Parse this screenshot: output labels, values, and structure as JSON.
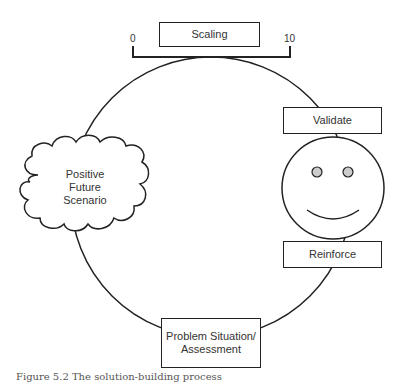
{
  "diagram": {
    "nodes": {
      "scaling": {
        "label": "Scaling"
      },
      "scale_min": {
        "label": "0"
      },
      "scale_max": {
        "label": "10"
      },
      "validate": {
        "label": "Validate"
      },
      "reinforce": {
        "label": "Reinforce"
      },
      "positive_future": {
        "line1": "Positive",
        "line2": "Future",
        "line3": "Scenario"
      },
      "problem": {
        "line1": "Problem Situation/",
        "line2": "Assessment"
      }
    },
    "face": {
      "eye_color": "#cccccc",
      "expression": "smile"
    },
    "cycle": [
      "Problem Situation/ Assessment",
      "Positive Future Scenario",
      "Scaling",
      "Validate",
      "Reinforce"
    ],
    "stroke_color": "#222222"
  },
  "caption": "Figure 5.2  The solution-building process"
}
